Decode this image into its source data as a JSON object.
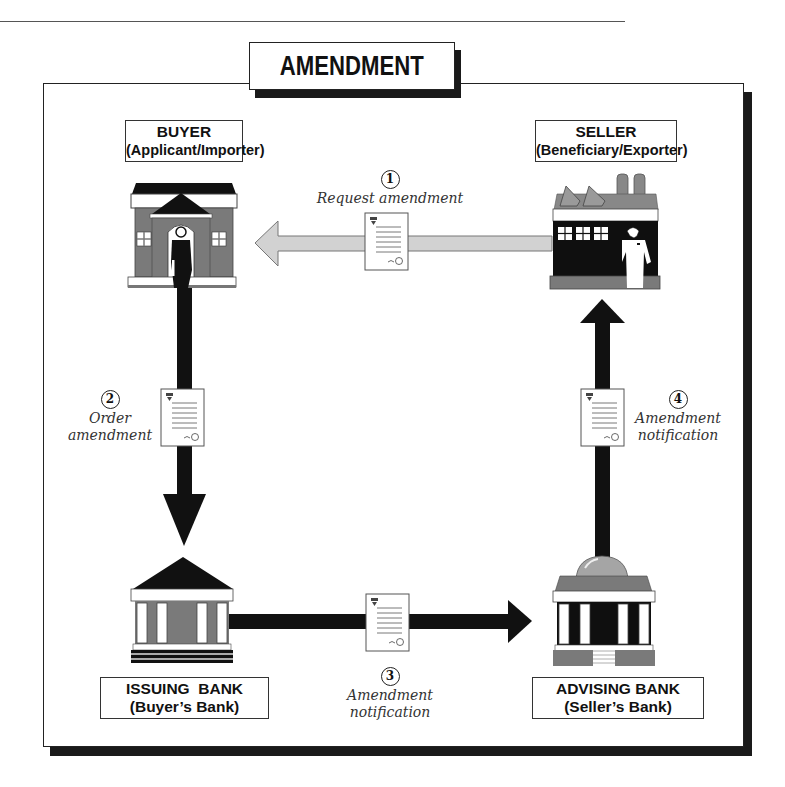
{
  "title": "AMENDMENT",
  "parties": {
    "buyer": {
      "line1": "BUYER",
      "line2": "(Applicant/Importer)"
    },
    "seller": {
      "line1": "SELLER",
      "line2": "(Beneficiary/Exporter)"
    },
    "issuing_bank": {
      "line1": "ISSUING  BANK",
      "line2": "(Buyer’s Bank)"
    },
    "advising_bank": {
      "line1": "ADVISING BANK",
      "line2": "(Seller’s Bank)"
    }
  },
  "steps": [
    {
      "number": "1",
      "line1": "Request amendment",
      "line2": "",
      "from": "seller",
      "to": "buyer"
    },
    {
      "number": "2",
      "line1": "Order",
      "line2": "amendment",
      "from": "buyer",
      "to": "issuing_bank"
    },
    {
      "number": "3",
      "line1": "Amendment",
      "line2": "notification",
      "from": "issuing_bank",
      "to": "advising_bank"
    },
    {
      "number": "4",
      "line1": "Amendment",
      "line2": "notification",
      "from": "advising_bank",
      "to": "seller"
    }
  ],
  "icons": {
    "buyer": "house-with-person-icon",
    "seller": "factory-with-person-icon",
    "issuing_bank": "bank-pediment-icon",
    "advising_bank": "bank-dome-icon",
    "document": "document-icon"
  },
  "colors": {
    "arrow_dark": "#111111",
    "arrow_light": "#cfcfcf",
    "building_gray": "#7a7a7a",
    "frame": "#222222"
  }
}
